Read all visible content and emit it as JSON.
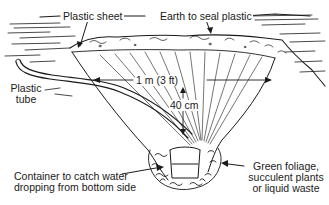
{
  "diagram": {
    "labels": {
      "plastic_sheet": "Plastic sheet",
      "earth_seal": "Earth to seal plastic",
      "plastic_tube_line1": "Plastic",
      "plastic_tube_line2": "tube",
      "width_dimension": "1 m (3 ft)",
      "depth_dimension": "40 cm",
      "container_line1": "Container to catch water",
      "container_line2": "dropping from bottom side",
      "foliage_line1": "Green foliage,",
      "foliage_line2": "succulent plants",
      "foliage_line3": "or liquid waste"
    },
    "colors": {
      "ink": "#1a1a1a",
      "background": "#ffffff"
    }
  }
}
